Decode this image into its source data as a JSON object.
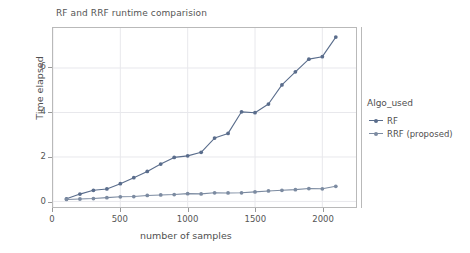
{
  "chart_data": {
    "type": "line",
    "title": "RF and RRF runtime comparision",
    "xlabel": "number of samples",
    "ylabel": "Time elapsed",
    "xlim": [
      0,
      2250
    ],
    "ylim": [
      -0.25,
      7.8
    ],
    "xticks": [
      "0",
      "500",
      "1000",
      "1500",
      "2000"
    ],
    "xtick_values": [
      0,
      500,
      1000,
      1500,
      2000
    ],
    "yticks": [
      "0",
      "2",
      "4",
      "6"
    ],
    "ytick_values": [
      0,
      2,
      4,
      6
    ],
    "grid": true,
    "legend_position": "right",
    "legend_title": "Algo_used",
    "x": [
      100,
      200,
      300,
      400,
      500,
      600,
      700,
      800,
      900,
      1000,
      1100,
      1200,
      1300,
      1400,
      1500,
      1600,
      1700,
      1800,
      1900,
      2000,
      2100
    ],
    "series": [
      {
        "name": "RF",
        "color": "#5a6d8c",
        "marker": "circle",
        "values": [
          0.12,
          0.33,
          0.5,
          0.56,
          0.8,
          1.07,
          1.35,
          1.68,
          1.98,
          2.05,
          2.21,
          2.85,
          3.06,
          4.03,
          3.99,
          4.38,
          5.24,
          5.83,
          6.4,
          6.51,
          7.39
        ]
      },
      {
        "name": "RRF (proposed)",
        "color": "#7c8ba1",
        "marker": "circle",
        "values": [
          0.09,
          0.11,
          0.13,
          0.17,
          0.21,
          0.22,
          0.27,
          0.29,
          0.31,
          0.35,
          0.34,
          0.39,
          0.38,
          0.39,
          0.43,
          0.47,
          0.5,
          0.53,
          0.58,
          0.57,
          0.68
        ]
      }
    ]
  },
  "legend": {
    "title": "Algo_used",
    "entries": [
      {
        "label": "RF",
        "color": "#5a6d8c"
      },
      {
        "label": "RRF (proposed)",
        "color": "#7c8ba1"
      }
    ]
  },
  "colors": {
    "rf": "#5a6d8c",
    "rrf": "#7c8ba1",
    "grid": "#e8e8ec",
    "spine": "#b9b9b9",
    "text": "#4f4f4f",
    "background": "#ffffff"
  }
}
